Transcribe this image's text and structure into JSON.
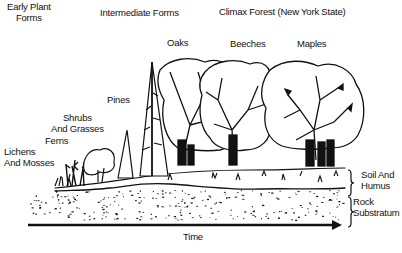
{
  "stage_headers": {
    "early": [
      "Early Plant",
      "Forms"
    ],
    "intermediate": "Intermediate Forms",
    "climax": "Climax Forest (New York State)"
  },
  "plants": {
    "lichens": [
      "Lichens",
      "And Mosses"
    ],
    "ferns": "Ferns",
    "shrubs": [
      "Shrubs",
      "And Grasses"
    ],
    "pines": "Pines",
    "oaks": "Oaks",
    "beeches": "Beeches",
    "maples": "Maples"
  },
  "layers": {
    "soil": [
      "Soil And",
      "Humus"
    ],
    "rock": [
      "Rock",
      "Substratum"
    ]
  },
  "axis": {
    "label": "Time",
    "direction": "left-to-right"
  },
  "colors": {
    "ink": "#111111",
    "background": "#ffffff"
  }
}
